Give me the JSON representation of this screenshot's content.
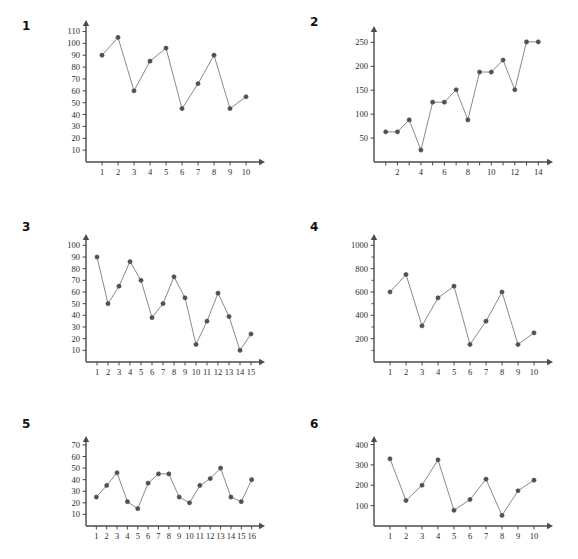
{
  "page": {
    "background_color": "#ffffff",
    "top_partial_text": "· · · · ·",
    "axis_color": "#4a4a4a",
    "line_color": "#8a8a8a",
    "marker_color": "#4f4f4f",
    "text_color": "#2b2b2b"
  },
  "charts": [
    {
      "index": "1",
      "chart_data": {
        "type": "line",
        "title": "1",
        "xlabel": "",
        "ylabel": "",
        "grid": false,
        "legend": "none",
        "x": [
          1,
          2,
          3,
          4,
          5,
          6,
          7,
          8,
          9,
          10
        ],
        "values": [
          90,
          105,
          60,
          85,
          96,
          45,
          66,
          90,
          45,
          55
        ],
        "xlim": [
          0,
          11
        ],
        "ylim": [
          0,
          118
        ],
        "x_ticks": [
          1,
          2,
          3,
          4,
          5,
          6,
          7,
          8,
          9,
          10
        ],
        "x_tick_labels": [
          "1",
          "2",
          "3",
          "4",
          "5",
          "6",
          "7",
          "8",
          "9",
          "10"
        ],
        "y_ticks": [
          10,
          20,
          30,
          40,
          50,
          60,
          70,
          80,
          90,
          100,
          110
        ],
        "y_tick_labels": [
          "10",
          "20",
          "30",
          "40",
          "50",
          "60",
          "70",
          "80",
          "90",
          "100",
          "110"
        ]
      }
    },
    {
      "index": "2",
      "chart_data": {
        "type": "line",
        "title": "2",
        "xlabel": "",
        "ylabel": "",
        "grid": false,
        "legend": "none",
        "x": [
          1,
          2,
          3,
          4,
          5,
          6,
          7,
          8,
          9,
          10,
          11,
          12,
          13,
          14
        ],
        "values": [
          63,
          63,
          88,
          25,
          125,
          125,
          151,
          88,
          188,
          188,
          213,
          151,
          251,
          251
        ],
        "xlim": [
          0,
          15
        ],
        "ylim": [
          0,
          280
        ],
        "x_ticks": [
          1,
          2,
          3,
          4,
          5,
          6,
          7,
          8,
          9,
          10,
          11,
          12,
          13,
          14
        ],
        "x_tick_labels": [
          "",
          "2",
          "",
          "4",
          "",
          "6",
          "",
          "8",
          "",
          "10",
          "",
          "12",
          "",
          "14"
        ],
        "y_ticks": [
          50,
          100,
          150,
          200,
          250
        ],
        "y_tick_labels": [
          "50",
          "100",
          "150",
          "200",
          "250"
        ]
      }
    },
    {
      "index": "3",
      "chart_data": {
        "type": "line",
        "title": "3",
        "xlabel": "",
        "ylabel": "",
        "grid": false,
        "legend": "none",
        "x": [
          1,
          2,
          3,
          4,
          5,
          6,
          7,
          8,
          9,
          10,
          11,
          12,
          13,
          14,
          15
        ],
        "values": [
          90,
          50,
          65,
          86,
          70,
          38,
          50,
          73,
          55,
          15,
          35,
          59,
          39,
          10,
          24
        ],
        "xlim": [
          0,
          16
        ],
        "ylim": [
          0,
          108
        ],
        "x_ticks": [
          1,
          2,
          3,
          4,
          5,
          6,
          7,
          8,
          9,
          10,
          11,
          12,
          13,
          14,
          15
        ],
        "x_tick_labels": [
          "1",
          "2",
          "3",
          "4",
          "5",
          "6",
          "7",
          "8",
          "9",
          "10",
          "11",
          "12",
          "13",
          "14",
          "15"
        ],
        "y_ticks": [
          10,
          20,
          30,
          40,
          50,
          60,
          70,
          80,
          90,
          100
        ],
        "y_tick_labels": [
          "10",
          "20",
          "30",
          "40",
          "50",
          "60",
          "70",
          "80",
          "90",
          "100"
        ]
      }
    },
    {
      "index": "4",
      "chart_data": {
        "type": "line",
        "title": "4",
        "xlabel": "",
        "ylabel": "",
        "grid": false,
        "legend": "none",
        "x": [
          1,
          2,
          3,
          4,
          5,
          6,
          7,
          8,
          9,
          10
        ],
        "values": [
          600,
          750,
          310,
          550,
          650,
          150,
          350,
          600,
          150,
          250
        ],
        "xlim": [
          0,
          11
        ],
        "ylim": [
          0,
          1080
        ],
        "x_ticks": [
          1,
          2,
          3,
          4,
          5,
          6,
          7,
          8,
          9,
          10
        ],
        "x_tick_labels": [
          "1",
          "2",
          "3",
          "4",
          "5",
          "6",
          "7",
          "8",
          "9",
          "10"
        ],
        "y_ticks": [
          200,
          400,
          600,
          800,
          1000
        ],
        "y_tick_labels": [
          "200",
          "400",
          "600",
          "800",
          "1000"
        ],
        "y_minor_ticks": [
          100,
          300,
          500,
          700,
          900
        ]
      }
    },
    {
      "index": "5",
      "chart_data": {
        "type": "line",
        "title": "5",
        "xlabel": "",
        "ylabel": "",
        "grid": false,
        "legend": "none",
        "x": [
          1,
          2,
          3,
          4,
          5,
          6,
          7,
          8,
          9,
          10,
          11,
          12,
          13,
          14,
          15,
          16
        ],
        "values": [
          25,
          35,
          46,
          21,
          15,
          37,
          45,
          45,
          25,
          20,
          35,
          41,
          50,
          25,
          21,
          40
        ],
        "xlim": [
          0,
          17
        ],
        "ylim": [
          0,
          76
        ],
        "x_ticks": [
          1,
          2,
          3,
          4,
          5,
          6,
          7,
          8,
          9,
          10,
          11,
          12,
          13,
          14,
          15,
          16
        ],
        "x_tick_labels": [
          "1",
          "2",
          "3",
          "4",
          "5",
          "6",
          "7",
          "8",
          "9",
          "10",
          "11",
          "12",
          "13",
          "14",
          "15",
          "16"
        ],
        "y_ticks": [
          10,
          20,
          30,
          40,
          50,
          60,
          70
        ],
        "y_tick_labels": [
          "10",
          "20",
          "30",
          "40",
          "50",
          "60",
          "70"
        ]
      }
    },
    {
      "index": "6",
      "chart_data": {
        "type": "line",
        "title": "6",
        "xlabel": "",
        "ylabel": "",
        "grid": false,
        "legend": "none",
        "x": [
          1,
          2,
          3,
          4,
          5,
          6,
          7,
          8,
          9,
          10
        ],
        "values": [
          330,
          125,
          200,
          325,
          77,
          130,
          230,
          52,
          173,
          225
        ],
        "xlim": [
          0,
          11
        ],
        "ylim": [
          0,
          432
        ],
        "x_ticks": [
          1,
          2,
          3,
          4,
          5,
          6,
          7,
          8,
          9,
          10
        ],
        "x_tick_labels": [
          "1",
          "2",
          "3",
          "4",
          "5",
          "6",
          "7",
          "8",
          "9",
          "10"
        ],
        "y_ticks": [
          100,
          200,
          300,
          400
        ],
        "y_tick_labels": [
          "100",
          "200",
          "300",
          "400"
        ]
      }
    }
  ],
  "layout": {
    "panels": [
      {
        "left": 0,
        "top": 8,
        "width": 289,
        "height": 197,
        "index_left": 22,
        "index_top": 20,
        "plot_left": 56,
        "plot_top": 14,
        "plot_width": 212,
        "plot_height": 178
      },
      {
        "left": 289,
        "top": 8,
        "width": 289,
        "height": 197,
        "index_left": 310,
        "index_top": 16,
        "plot_left": 344,
        "plot_top": 20,
        "plot_width": 212,
        "plot_height": 172
      },
      {
        "left": 0,
        "top": 205,
        "width": 289,
        "height": 195,
        "index_left": 22,
        "index_top": 221,
        "plot_left": 56,
        "plot_top": 228,
        "plot_width": 212,
        "plot_height": 164
      },
      {
        "left": 289,
        "top": 205,
        "width": 289,
        "height": 195,
        "index_left": 310,
        "index_top": 221,
        "plot_left": 344,
        "plot_top": 228,
        "plot_width": 212,
        "plot_height": 164
      },
      {
        "left": 0,
        "top": 400,
        "width": 289,
        "height": 159,
        "index_left": 22,
        "index_top": 418,
        "plot_left": 56,
        "plot_top": 430,
        "plot_width": 212,
        "plot_height": 126
      },
      {
        "left": 289,
        "top": 400,
        "width": 289,
        "height": 159,
        "index_left": 310,
        "index_top": 418,
        "plot_left": 344,
        "plot_top": 430,
        "plot_width": 212,
        "plot_height": 126
      }
    ]
  }
}
